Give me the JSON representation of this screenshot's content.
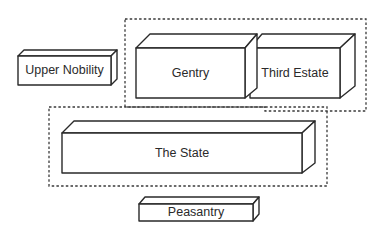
{
  "diagram": {
    "type": "block-relationship",
    "groups": [
      {
        "id": "privileged-group",
        "members": [
          "Gentry",
          "Third Estate"
        ],
        "style": "dashed"
      },
      {
        "id": "state-group",
        "members": [
          "The State"
        ],
        "style": "dashed"
      }
    ],
    "blocks": [
      {
        "id": "upper-nobility",
        "label": "Upper Nobility"
      },
      {
        "id": "gentry",
        "label": "Gentry"
      },
      {
        "id": "third-estate",
        "label": "Third Estate"
      },
      {
        "id": "the-state",
        "label": "The State"
      },
      {
        "id": "peasantry",
        "label": "Peasantry"
      }
    ],
    "colors": {
      "line": "#2a2a2a",
      "background": "#ffffff"
    }
  }
}
